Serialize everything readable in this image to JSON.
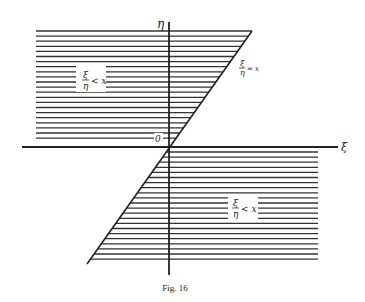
{
  "figure": {
    "caption": "Fig. 16",
    "axes": {
      "horizontal_label": "ξ",
      "vertical_label": "η",
      "origin_label": "0"
    },
    "line_label": {
      "numerator": "ξ",
      "denominator": "η",
      "relation": "= x"
    },
    "region_upper": {
      "numerator": "ξ",
      "denominator": "η",
      "relation": "< x"
    },
    "region_lower": {
      "numerator": "ξ",
      "denominator": "η",
      "relation": "< x"
    },
    "colors": {
      "ink": "#222222",
      "background": "#ffffff"
    }
  }
}
